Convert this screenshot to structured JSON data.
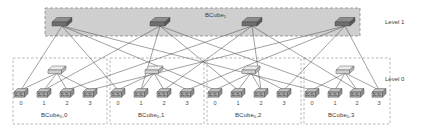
{
  "figure": {
    "type": "diagram",
    "width": 421,
    "height": 132,
    "background": "#ffffff"
  },
  "colors": {
    "level1_band_fill": "#cfcfcf",
    "level1_band_stroke": "#8a8a8a",
    "dashed_box_stroke": "#9a9a9a",
    "link_stroke": "#555555",
    "switch_l1_top": "#8d8d8d",
    "switch_l1_side": "#6f6f6f",
    "switch_l0_top": "#e8e8e8",
    "switch_l0_side": "#bdbdbd",
    "server_top": "#b8b8b8",
    "server_side": "#8f8f8f",
    "server_face": "#a5a5a5",
    "text": "#3a3a3a"
  },
  "level1": {
    "band_label": "BCube",
    "band_label_sub": "1",
    "side_label": "Level 1",
    "switch_count": 4,
    "switches": [
      {
        "id": "l1-switch-0",
        "x": 62,
        "y": 20
      },
      {
        "id": "l1-switch-1",
        "x": 160,
        "y": 20
      },
      {
        "id": "l1-switch-2",
        "x": 252,
        "y": 20
      },
      {
        "id": "l1-switch-3",
        "x": 345,
        "y": 20
      }
    ],
    "band": {
      "x": 45,
      "y": 8,
      "w": 315,
      "h": 28
    }
  },
  "level0": {
    "side_label": "Level 0",
    "group_count": 4,
    "servers_per_group": 4,
    "server_labels": [
      "0",
      "1",
      "2",
      "3"
    ],
    "groups": [
      {
        "id": "bcube0-0",
        "label": "BCube",
        "label_sub": "0",
        "label_suffix": ",0",
        "box": {
          "x": 13,
          "y": 58,
          "w": 94,
          "h": 66
        },
        "switch": {
          "x": 57,
          "y": 70
        },
        "servers": [
          {
            "label": "0",
            "x": 21,
            "y": 92
          },
          {
            "label": "1",
            "x": 44,
            "y": 92
          },
          {
            "label": "2",
            "x": 67,
            "y": 92
          },
          {
            "label": "3",
            "x": 90,
            "y": 92
          }
        ]
      },
      {
        "id": "bcube0-1",
        "label": "BCube",
        "label_sub": "0",
        "label_suffix": ",1",
        "box": {
          "x": 110,
          "y": 58,
          "w": 94,
          "h": 66
        },
        "switch": {
          "x": 154,
          "y": 70
        },
        "servers": [
          {
            "label": "0",
            "x": 118,
            "y": 92
          },
          {
            "label": "1",
            "x": 141,
            "y": 92
          },
          {
            "label": "2",
            "x": 164,
            "y": 92
          },
          {
            "label": "3",
            "x": 187,
            "y": 92
          }
        ]
      },
      {
        "id": "bcube0-2",
        "label": "BCube",
        "label_sub": "0",
        "label_suffix": ",2",
        "box": {
          "x": 207,
          "y": 58,
          "w": 94,
          "h": 66
        },
        "switch": {
          "x": 251,
          "y": 70
        },
        "servers": [
          {
            "label": "0",
            "x": 215,
            "y": 92
          },
          {
            "label": "1",
            "x": 238,
            "y": 92
          },
          {
            "label": "2",
            "x": 261,
            "y": 92
          },
          {
            "label": "3",
            "x": 284,
            "y": 92
          }
        ]
      },
      {
        "id": "bcube0-3",
        "label": "BCube",
        "label_sub": "0",
        "label_suffix": ",3",
        "box": {
          "x": 304,
          "y": 58,
          "w": 86,
          "h": 66
        },
        "switch": {
          "x": 345,
          "y": 70
        },
        "servers": [
          {
            "label": "0",
            "x": 312,
            "y": 92
          },
          {
            "label": "1",
            "x": 335,
            "y": 92
          },
          {
            "label": "2",
            "x": 357,
            "y": 92
          },
          {
            "label": "3",
            "x": 379,
            "y": 92
          }
        ]
      }
    ]
  },
  "links": {
    "level0_note": "each level-0 switch connects to the 4 servers in its own BCube0 group",
    "level1_note": "level-1 switch i connects to server i of every BCube0 group"
  }
}
